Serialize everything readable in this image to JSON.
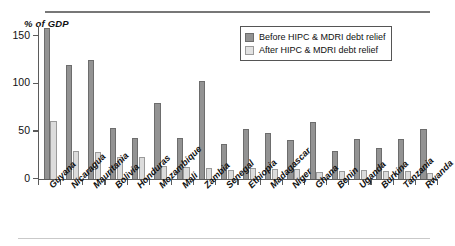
{
  "chart_data": {
    "type": "bar",
    "title": "",
    "ylabel": "% of GDP",
    "xlabel": "",
    "ylim": [
      0,
      160
    ],
    "yticks": [
      0,
      50,
      100,
      150
    ],
    "ytick_labels": [
      "0",
      "50",
      "100",
      "150"
    ],
    "grid": false,
    "legend_position": "top-right",
    "categories": [
      "Guyana",
      "Nicaragua",
      "Mauritania",
      "Bolivia",
      "Honduras",
      "Mozambique",
      "Mali",
      "Zambia",
      "Senegal",
      "Ethiopia",
      "Madagascar",
      "Niger",
      "Ghana",
      "Benin",
      "Uganda",
      "Burkina",
      "Tanzania",
      "Rwanda"
    ],
    "series": [
      {
        "name": "Before HIPC & MDRI debt relief",
        "color": "#939393",
        "values": [
          158,
          119,
          124,
          53,
          43,
          79,
          43,
          102,
          36,
          52,
          48,
          40,
          59,
          29,
          41,
          32,
          41,
          52
        ]
      },
      {
        "name": "After HIPC & MDRI debt relief",
        "color": "#dcdcdc",
        "values": [
          60,
          29,
          28,
          23,
          23,
          13,
          12,
          11,
          9,
          11,
          10,
          10,
          7,
          8,
          9,
          8,
          8,
          6
        ]
      }
    ]
  },
  "legend": {
    "items": [
      {
        "label": "Before HIPC & MDRI debt relief",
        "swatch": "before"
      },
      {
        "label": "After HIPC & MDRI debt relief",
        "swatch": "after"
      }
    ]
  },
  "colors": {
    "before": "#939393",
    "after": "#dcdcdc",
    "axis": "#5b5b5b",
    "rule": "#777777"
  }
}
